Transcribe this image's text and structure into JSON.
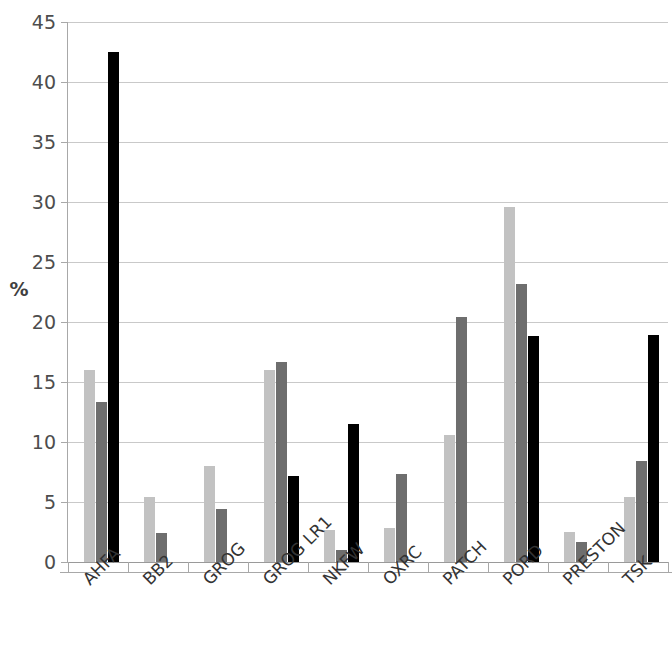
{
  "chart_data": {
    "type": "bar",
    "title": "",
    "subtitle": "",
    "xlabel": "",
    "ylabel": "%",
    "ylim": [
      0,
      45
    ],
    "ytick_interval": 5,
    "yticks": [
      0,
      5,
      10,
      15,
      20,
      25,
      30,
      35,
      40,
      45
    ],
    "ytick_labels": [
      "0",
      "5",
      "10",
      "15",
      "20",
      "25",
      "30",
      "35",
      "40",
      "45"
    ],
    "grid": true,
    "legend": "none",
    "categories": [
      "AHFA",
      "BB2",
      "GROG",
      "GROG LR1",
      "NKFW",
      "OXRC",
      "PATCH",
      "PORD",
      "PRESTON",
      "TSK"
    ],
    "series": [
      {
        "name": "series-1",
        "color": "#c2c2c2",
        "values": [
          16.0,
          5.4,
          8.0,
          16.0,
          2.7,
          2.8,
          10.6,
          29.6,
          2.5,
          5.4
        ]
      },
      {
        "name": "series-2",
        "color": "#6e6e6e",
        "values": [
          13.3,
          2.4,
          4.4,
          16.7,
          1.0,
          7.3,
          20.4,
          23.2,
          1.7,
          8.4
        ]
      },
      {
        "name": "series-3",
        "color": "#000000",
        "values": [
          42.5,
          null,
          null,
          7.2,
          11.5,
          null,
          null,
          18.8,
          null,
          18.9
        ]
      }
    ]
  },
  "axis": {
    "y_title": "%"
  }
}
